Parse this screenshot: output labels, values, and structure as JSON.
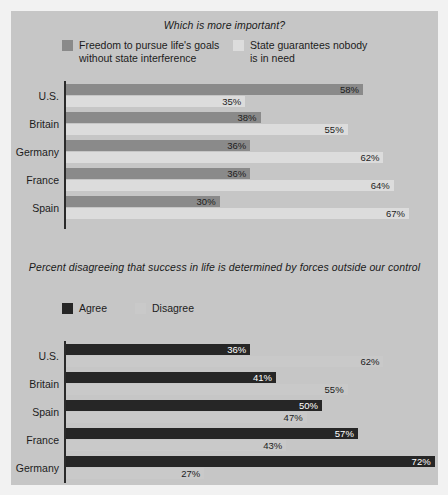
{
  "colors": {
    "page_background": "#f2f2f2",
    "panel_background": "#c6c6c6",
    "axis": "#2a2a2a",
    "chart1_series1": "#8a8a8a",
    "chart1_series2": "#dcdcdc",
    "chart2_series1": "#262626",
    "chart2_series2": "#c9c9c9",
    "label_dark": "#1c1c1c",
    "label_light": "#ffffff"
  },
  "chart_data": [
    {
      "type": "bar",
      "orientation": "horizontal",
      "title": "Which is more important?",
      "xlabel": "",
      "ylabel": "",
      "xlim": [
        0,
        72
      ],
      "grid": false,
      "legend_position": "top",
      "categories": [
        "U.S.",
        "Britain",
        "Germany",
        "France",
        "Spain"
      ],
      "series": [
        {
          "name": "Freedom to pursue life's goals\nwithout state interference",
          "color": "#8a8a8a",
          "label_color": "#1c1c1c",
          "label_inside": true,
          "values": [
            58,
            38,
            36,
            36,
            30
          ],
          "value_labels": [
            "58%",
            "38%",
            "36%",
            "36%",
            "30%"
          ]
        },
        {
          "name": "State guarantees nobody\nis in need",
          "color": "#dcdcdc",
          "label_color": "#1c1c1c",
          "label_inside": true,
          "values": [
            35,
            55,
            62,
            64,
            67
          ],
          "value_labels": [
            "35%",
            "55%",
            "62%",
            "64%",
            "67%"
          ]
        }
      ]
    },
    {
      "type": "bar",
      "orientation": "horizontal",
      "title": "Percent disagreeing that success in life is determined\nby forces outside our control",
      "xlabel": "",
      "ylabel": "",
      "xlim": [
        0,
        72
      ],
      "grid": false,
      "legend_position": "top",
      "categories": [
        "U.S.",
        "Britain",
        "Spain",
        "France",
        "Germany"
      ],
      "series": [
        {
          "name": "Agree",
          "color": "#262626",
          "label_color": "#ffffff",
          "label_inside": true,
          "values": [
            36,
            41,
            50,
            57,
            72
          ],
          "value_labels": [
            "36%",
            "41%",
            "50%",
            "57%",
            "72%"
          ]
        },
        {
          "name": "Disagree",
          "color": "#c9c9c9",
          "label_color": "#1c1c1c",
          "label_inside": true,
          "values": [
            62,
            55,
            47,
            43,
            27
          ],
          "value_labels": [
            "62%",
            "55%",
            "47%",
            "43%",
            "27%"
          ]
        }
      ]
    }
  ]
}
